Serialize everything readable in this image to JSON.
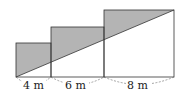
{
  "diagram": {
    "squares": [
      {
        "side": 4,
        "label": "4 m"
      },
      {
        "side": 6,
        "label": "6 m"
      },
      {
        "side": 8,
        "label": "8 m"
      }
    ],
    "colors": {
      "shade": "#b4b4b4",
      "stroke": "#333333"
    }
  }
}
